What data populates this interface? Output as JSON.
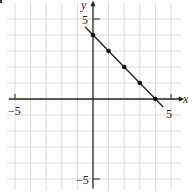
{
  "chart_data": {
    "type": "line",
    "title": "",
    "xlabel": "x",
    "ylabel": "y",
    "xlim": [
      -5.5,
      5.5
    ],
    "ylim": [
      -5.5,
      5.5
    ],
    "grid": true,
    "x_tick_labels": [
      {
        "value": -5,
        "label": "−5"
      },
      {
        "value": 5,
        "label": "5"
      }
    ],
    "y_tick_labels": [
      {
        "value": 5,
        "label": "5"
      },
      {
        "value": -5,
        "label": "−5"
      }
    ],
    "line": {
      "x": [
        -0.5,
        4.5
      ],
      "y": [
        4.5,
        -0.5
      ],
      "equation": "y = -x + 4"
    },
    "points": [
      {
        "x": 0,
        "y": 4
      },
      {
        "x": 1,
        "y": 3
      },
      {
        "x": 2,
        "y": 2
      },
      {
        "x": 3,
        "y": 1
      },
      {
        "x": 4,
        "y": 0
      }
    ],
    "colors": {
      "grid": "#d9d9d9",
      "axis": "#222222",
      "line": "#222222",
      "point": "#111111"
    }
  },
  "labels": {
    "x_axis": "x",
    "y_axis": "y",
    "x_min": "−5",
    "x_max": "5",
    "y_max": "5",
    "y_min": "−5"
  }
}
